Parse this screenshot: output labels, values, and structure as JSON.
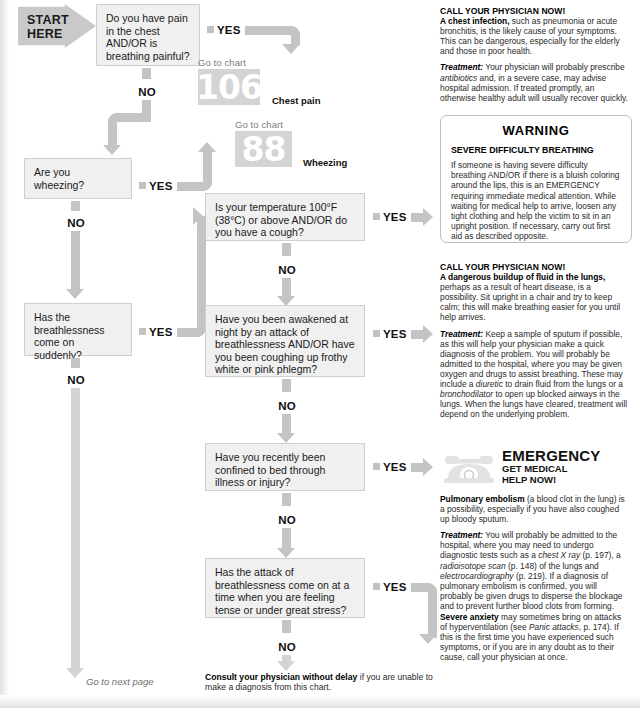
{
  "chart": {
    "start_label": "START\nHERE",
    "start_label_line1": "START",
    "start_label_line2": "HERE",
    "yes_label": "YES",
    "no_label": "NO",
    "go_to_chart_label": "Go to chart"
  },
  "questions": [
    {
      "id": "q1",
      "text": "Do you have pain in the chest AND/OR is breathing painful?"
    },
    {
      "id": "q2",
      "text": "Are you wheezing?"
    },
    {
      "id": "q3",
      "text": "Is your temperature 100°F (38°C) or above AND/OR do you have a cough?"
    },
    {
      "id": "q4",
      "text": "Has the breathlessness come on suddenly?"
    },
    {
      "id": "q5",
      "text": "Have you been awakened at night by an attack of breathlessness AND/OR have you been coughing up frothy white or pink phlegm?"
    },
    {
      "id": "q6",
      "text": "Have you recently been confined to bed through illness or injury?"
    },
    {
      "id": "q7",
      "text": "Has the attack of breathlessness come on at a time when you are feeling tense or under great stress?"
    }
  ],
  "chart_refs": [
    {
      "number": "106",
      "label": "Chest pain"
    },
    {
      "number": "88",
      "label": "Wheezing"
    }
  ],
  "advice": {
    "chest_infection": {
      "heading": "CALL YOUR PHYSICIAN NOW!",
      "lead": "A chest infection,",
      "body": " such as pneumonia or acute bronchitis, is the likely cause of your symptoms. This can be dangerous, especially for the elderly and those in poor health.",
      "treatment_label": "Treatment:",
      "treatment_a": " Your physician will probably prescribe ",
      "treatment_em": "antibiotics",
      "treatment_b": " and, in a severe case, may advise hospital admission. If treated promptly, an otherwise healthy adult will usually recover quickly."
    },
    "warning": {
      "title": "WARNING",
      "subtitle": "SEVERE DIFFICULTY BREATHING",
      "body": "If someone is having severe difficulty breathing AND/OR if there is a bluish coloring around the lips, this is an EMERGENCY requiring immediate medical attention. While waiting for medical help to arrive, loosen any tight clothing and help the victim to sit in an upright position. If necessary, carry out first aid as described opposite."
    },
    "fluid_lungs": {
      "heading": "CALL YOUR PHYSICIAN NOW!",
      "lead": "A dangerous buildup of fluid in the lungs,",
      "body": " perhaps as a result of heart disease, is a possibility. Sit upright in a chair and try to keep calm; this will make breathing easier for you until help arrives.",
      "treatment_label": "Treatment:",
      "treatment_a": " Keep a sample of sputum if possible, as this will help your physician make a quick diagnosis of the problem. You will probably be admitted to the hospital, where you may be given oxygen and drugs to assist breathing. These may include a ",
      "treatment_em1": "diuretic",
      "treatment_b": " to drain fluid from the lungs or a ",
      "treatment_em2": "bronchodilator",
      "treatment_c": " to open up blocked airways in the lungs. When the lungs have cleared, treatment will depend on the underlying problem."
    },
    "emergency": {
      "title": "EMERGENCY",
      "sub_line1": "GET MEDICAL",
      "sub_line2": "HELP NOW!",
      "lead": "Pulmonary embolism",
      "body": " (a blood clot in the lung) is a possibility, especially if you have also coughed up bloody sputum.",
      "treatment_label": "Treatment:",
      "treatment_a": " You will probably be admitted to the hospital, where you may need to undergo diagnostic tests such as a ",
      "treatment_em1": "chest X ray",
      "treatment_b": " (p. 197), a ",
      "treatment_em2": "radioisotope scan",
      "treatment_c": " (p. 148) of the lungs and ",
      "treatment_em3": "electrocardiography",
      "treatment_d": " (p. 219). If a diagnosis of pulmonary embolism is confirmed, you will probably be given drugs to disperse the blockage and to prevent further blood clots from forming."
    },
    "anxiety": {
      "lead": "Severe anxiety",
      "body_a": " may sometimes bring on attacks of hyperventilation (see ",
      "em": "Panic attacks",
      "body_b": ", p. 174). If this is the first time you have experienced such symptoms, or if you are in any doubt as to their cause, call your physician at once."
    }
  },
  "footer": {
    "go_to_next_page": "Go to next page",
    "consult_lead": "Consult your physician without delay",
    "consult_body": " if you are unable to make a diagnosis from this chart."
  },
  "colors": {
    "connector": "#c4c4c4",
    "connector_light": "#d3d3d3",
    "box_fill": "#f0f0f0",
    "box_border": "#cfcfcf",
    "chart_block": "#d4d4d4",
    "muted_text": "#7d7d7d"
  }
}
